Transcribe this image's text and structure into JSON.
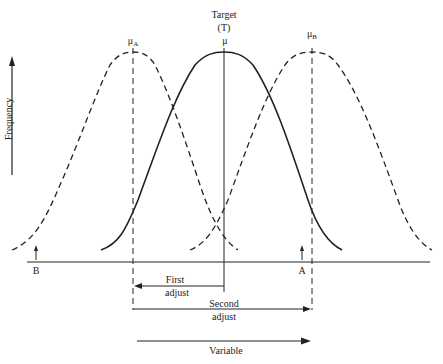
{
  "diagram": {
    "target": {
      "line1": "Target",
      "line2": "(T)",
      "mu": "μ"
    },
    "mu_a": {
      "symbol": "μ",
      "sub": "A"
    },
    "mu_b": {
      "symbol": "μ",
      "sub": "B"
    },
    "y_axis_label": "Frequency",
    "x_axis_label": "Variable",
    "marker_a": "A",
    "marker_b": "B",
    "first_adjust": {
      "line1": "First",
      "line2": "adjust"
    },
    "second_adjust": {
      "line1": "Second",
      "line2": "adjust"
    },
    "curves": [
      {
        "name": "distribution-a",
        "style": "dashed",
        "peak_x": 133
      },
      {
        "name": "distribution-target",
        "style": "solid",
        "peak_x": 224
      },
      {
        "name": "distribution-b",
        "style": "dashed",
        "peak_x": 312
      }
    ],
    "colors": {
      "ink": "#222222",
      "background": "#ffffff"
    }
  }
}
